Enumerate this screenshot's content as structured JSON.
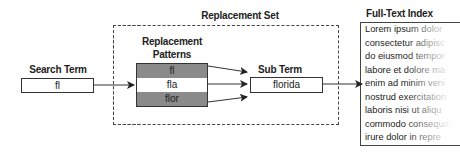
{
  "replacement_set": {
    "title": "Replacement Set"
  },
  "search_term": {
    "label": "Search Term",
    "value": "fl"
  },
  "replacement_patterns": {
    "label_line1": "Replacement",
    "label_line2": "Patterns",
    "rows": [
      "fl",
      "fla",
      "flor"
    ]
  },
  "sub_term": {
    "label": "Sub Term",
    "value": "florida"
  },
  "full_text_index": {
    "title": "Full-Text Index",
    "lines": [
      "Lorem ipsum dolor",
      "consectetur adipisc",
      "do eiusmod tempor",
      "labore et dolore ma",
      "enim ad minim veni",
      "nostrud exercitation",
      "laboris nisi ut aliqu",
      "commodo consequat",
      "irure dolor in repre"
    ]
  }
}
